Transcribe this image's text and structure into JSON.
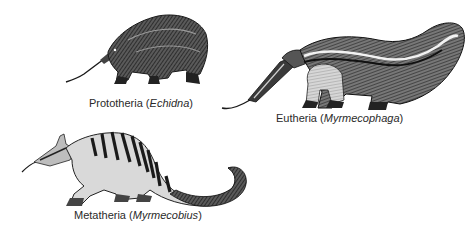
{
  "figure": {
    "panels": [
      {
        "id": "prototheria",
        "group": "Prototheria",
        "genus": "Echidna",
        "illustration": "echidna-illustration"
      },
      {
        "id": "eutheria",
        "group": "Eutheria",
        "genus": "Myrmecophaga",
        "illustration": "anteater-illustration"
      },
      {
        "id": "metatheria",
        "group": "Metatheria",
        "genus": "Myrmecobius",
        "illustration": "numbat-illustration"
      }
    ],
    "colors": {
      "ink": "#1a1a1a",
      "fur_light": "#cfcfcf",
      "fur_mid": "#6e6e6e",
      "background": "#ffffff",
      "label_text": "#2a2a2a"
    }
  }
}
